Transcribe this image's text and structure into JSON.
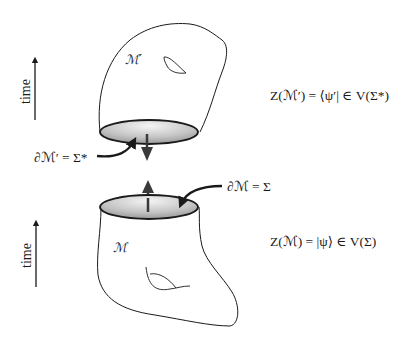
{
  "figure": {
    "time_axes": [
      {
        "label": "time",
        "direction": "up"
      },
      {
        "label": "time",
        "direction": "up"
      }
    ],
    "upper_manifold": {
      "label": "ℳ′",
      "boundary_label": "∂ℳ′ = Σ*",
      "boundary_arrow": "down",
      "formula": "Z(ℳ′) = ⟨ψ′| ∈ V(Σ*)"
    },
    "lower_manifold": {
      "label": "ℳ",
      "boundary_label": "∂ℳ = Σ",
      "boundary_arrow": "up",
      "formula": "Z(ℳ) = |ψ⟩ ∈ V(Σ)"
    },
    "colors": {
      "line": "#1a1a1a",
      "disk_light": "#f2f2f2",
      "disk_dark": "#8c8c8c",
      "arrow": "#3a3a3a"
    }
  }
}
